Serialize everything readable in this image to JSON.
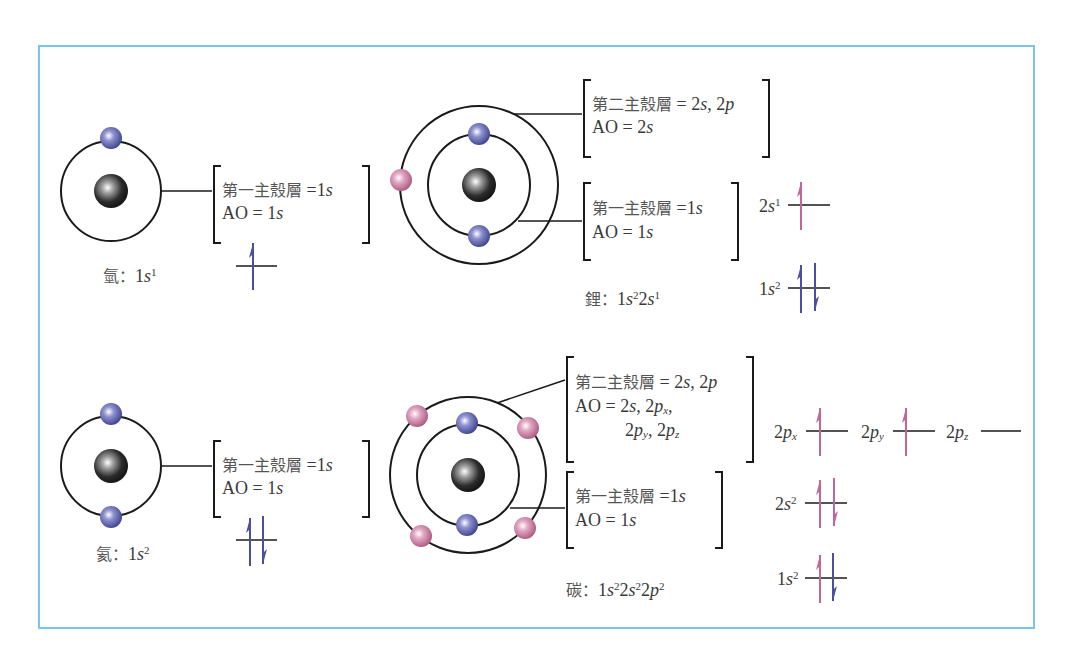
{
  "colors": {
    "frame_border": "#7cc4ea",
    "electron_inner": "#4b4f9e",
    "electron_outer": "#c57a9c",
    "nucleus": "#2a2a2a",
    "orbit_line": "#1a1a1a",
    "arrow_blue": "#4b4f9e",
    "arrow_pink": "#c0679a"
  },
  "atoms": [
    {
      "id": "hydrogen",
      "name": "氫",
      "config_parts": [
        {
          "t": "1"
        },
        {
          "t": "s",
          "i": true
        },
        {
          "t": "1",
          "sup": true
        }
      ],
      "shells": [
        {
          "label_cjk": "第一主殼層",
          "eq": "=1",
          "orbitals": "s",
          "ao": "AO = 1",
          "ao_orb": "s"
        }
      ],
      "orbital_diagram": [
        {
          "label": "",
          "electrons": [
            "up"
          ]
        }
      ]
    },
    {
      "id": "lithium",
      "name": "鋰",
      "config_text": "1s²2s¹",
      "shells": [
        {
          "label_cjk": "第二主殼層",
          "eq": "= 2",
          "value": "2s, 2p",
          "ao": "AO = 2s"
        },
        {
          "label_cjk": "第一主殼層",
          "eq": "=1",
          "value": "1s",
          "ao": "AO = 1s"
        }
      ],
      "orbital_diagram": [
        {
          "label": "2s¹",
          "electrons": [
            "up"
          ],
          "color": "pink"
        },
        {
          "label": "1s²",
          "electrons": [
            "up",
            "down"
          ],
          "color": "blue"
        }
      ]
    },
    {
      "id": "helium",
      "name": "氦",
      "config_text": "1s²",
      "shells": [
        {
          "label_cjk": "第一主殼層",
          "eq": "=1",
          "value": "1s",
          "ao": "AO = 1s"
        }
      ],
      "orbital_diagram": [
        {
          "label": "",
          "electrons": [
            "up",
            "down"
          ],
          "color": "blue"
        }
      ]
    },
    {
      "id": "carbon",
      "name": "碳",
      "config_text": "1s²2s²2p²",
      "shells": [
        {
          "label_cjk": "第二主殼層",
          "eq": "= 2",
          "value": "2s, 2p",
          "ao": "AO = 2s, 2px, 2py, 2pz"
        },
        {
          "label_cjk": "第一主殼層",
          "eq": "=1",
          "value": "1s",
          "ao": "AO = 1s"
        }
      ],
      "orbital_diagram": [
        {
          "label": "2px",
          "electrons": [
            "up"
          ],
          "color": "pink"
        },
        {
          "label": "2py",
          "electrons": [
            "up"
          ],
          "color": "pink"
        },
        {
          "label": "2pz",
          "electrons": [],
          "color": "pink"
        },
        {
          "label": "2s²",
          "electrons": [
            "up",
            "down"
          ],
          "color": "pink"
        },
        {
          "label": "1s²",
          "electrons": [
            "up-pink",
            "down-blue"
          ]
        }
      ]
    }
  ],
  "text": {
    "h_name": "氫",
    "h_shell_cjk": "第一主殼層",
    "h_shell_eq": " =1",
    "h_shell_orb": "s",
    "h_ao": "AO = 1",
    "h_ao_orb": "s",
    "h_cfg_1": "1",
    "h_cfg_s": "s",
    "h_cfg_sup": "1",
    "li_name": "鋰",
    "li_s2_cjk": "第二主殼層",
    "li_s2_eq": " = 2",
    "li_s2_s": "s",
    "li_s2_sep": ", 2",
    "li_s2_p": "p",
    "li_s2_ao": "AO = 2",
    "li_s2_ao_orb": "s",
    "li_s1_cjk": "第一主殼層",
    "li_s1_eq": " =1",
    "li_s1_orb": "s",
    "li_s1_ao": "AO = 1",
    "li_s1_ao_orb": "s",
    "li_cfg_a": "1",
    "li_cfg_s1": "s",
    "li_cfg_sup1": "2",
    "li_cfg_b": "2",
    "li_cfg_s2": "s",
    "li_cfg_sup2": "1",
    "li_ol_2s_n": "2",
    "li_ol_2s_s": "s",
    "li_ol_2s_sup": "1",
    "li_ol_1s_n": "1",
    "li_ol_1s_s": "s",
    "li_ol_1s_sup": "2",
    "he_name": "氦",
    "he_shell_cjk": "第一主殼層",
    "he_shell_eq": " =1",
    "he_shell_orb": "s",
    "he_ao": "AO = 1",
    "he_ao_orb": "s",
    "he_cfg_1": "1",
    "he_cfg_s": "s",
    "he_cfg_sup": "2",
    "c_name": "碳",
    "c_s2_cjk": "第二主殼層",
    "c_s2_eq": " = 2",
    "c_s2_s": "s",
    "c_s2_sep": ", 2",
    "c_s2_p": "p",
    "c_s2_ao_a": "AO = 2",
    "c_s2_ao_s": "s",
    "c_s2_ao_sep": ", 2",
    "c_s2_ao_p": "p",
    "c_s2_ao_x": "x",
    "c_s2_ao_comma": ",",
    "c_s2_ao2_a": "2",
    "c_s2_ao2_p": "p",
    "c_s2_ao2_y": "y",
    "c_s2_ao2_sep": ", 2",
    "c_s2_ao2_p2": "p",
    "c_s2_ao2_z": "z",
    "c_s1_cjk": "第一主殼層",
    "c_s1_eq": " =1",
    "c_s1_orb": "s",
    "c_s1_ao": "AO = 1",
    "c_s1_ao_orb": "s",
    "c_cfg_a": "1",
    "c_cfg_s1": "s",
    "c_cfg_sup1": "2",
    "c_cfg_b": "2",
    "c_cfg_s2": "s",
    "c_cfg_sup2": "2",
    "c_cfg_c": "2",
    "c_cfg_p": "p",
    "c_cfg_sup3": "2",
    "c_ol_2px_n": "2",
    "c_ol_2px_p": "p",
    "c_ol_2px_x": "x",
    "c_ol_2py_n": "2",
    "c_ol_2py_p": "p",
    "c_ol_2py_y": "y",
    "c_ol_2pz_n": "2",
    "c_ol_2pz_p": "p",
    "c_ol_2pz_z": "z",
    "c_ol_2s_n": "2",
    "c_ol_2s_s": "s",
    "c_ol_2s_sup": "2",
    "c_ol_1s_n": "1",
    "c_ol_1s_s": "s",
    "c_ol_1s_sup": "2",
    "colon": "："
  }
}
